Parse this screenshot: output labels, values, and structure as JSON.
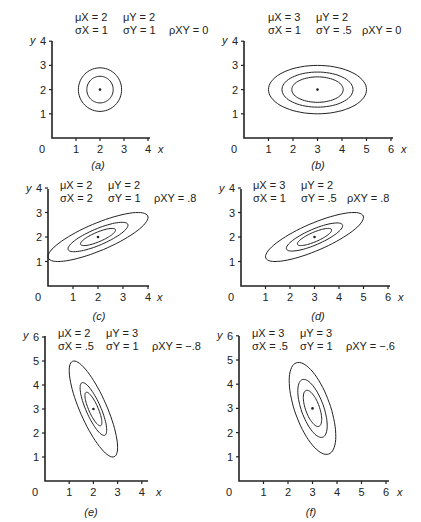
{
  "chart_data": [
    {
      "type": "contour",
      "panel": "a",
      "label": "(a)",
      "params": {
        "mu_x": 2,
        "mu_y": 2,
        "sigma_x": 1,
        "sigma_y": 1,
        "rho_xy": 0
      },
      "param_text": [
        "μX = 2",
        "μY = 2",
        "σX = 1",
        "σY = 1",
        "ρXY = 0"
      ],
      "xlabel": "x",
      "ylabel": "y",
      "xticks": [
        0,
        1,
        2,
        3,
        4
      ],
      "yticks": [
        1,
        2,
        3,
        4
      ],
      "xlim": [
        0,
        4
      ],
      "ylim": [
        0,
        4
      ],
      "contour_levels_sigma": [
        0.55,
        0.9
      ],
      "center": [
        2,
        2
      ]
    },
    {
      "type": "contour",
      "panel": "b",
      "label": "(b)",
      "params": {
        "mu_x": 3,
        "mu_y": 2,
        "sigma_x": 1,
        "sigma_y": 0.5,
        "rho_xy": 0
      },
      "param_text": [
        "μX = 3",
        "μY = 2",
        "σX = 1",
        "σY = .5",
        "ρXY = 0"
      ],
      "xlabel": "x",
      "ylabel": "y",
      "xticks": [
        0,
        1,
        2,
        3,
        4,
        5,
        6
      ],
      "yticks": [
        1,
        2,
        3,
        4
      ],
      "xlim": [
        0,
        6
      ],
      "ylim": [
        0,
        4
      ],
      "contour_levels_sigma": [
        1.05,
        1.45,
        2.0
      ],
      "center": [
        3,
        2
      ]
    },
    {
      "type": "contour",
      "panel": "c",
      "label": "(c)",
      "params": {
        "mu_x": 2,
        "mu_y": 2,
        "sigma_x": 2,
        "sigma_y": 1,
        "rho_xy": 0.8
      },
      "param_text": [
        "μX = 2",
        "μY = 2",
        "σX = 2",
        "σY = 1",
        "ρXY = .8"
      ],
      "xlabel": "x",
      "ylabel": "y",
      "xticks": [
        0,
        1,
        2,
        3,
        4
      ],
      "yticks": [
        1,
        2,
        3,
        4
      ],
      "xlim": [
        0,
        4
      ],
      "ylim": [
        0,
        4
      ],
      "contour_levels_sigma": [
        0.35,
        0.6,
        1.0
      ],
      "center": [
        2,
        2
      ]
    },
    {
      "type": "contour",
      "panel": "d",
      "label": "(d)",
      "params": {
        "mu_x": 3,
        "mu_y": 2,
        "sigma_x": 1,
        "sigma_y": 0.5,
        "rho_xy": 0.8
      },
      "param_text": [
        "μX = 3",
        "μY = 2",
        "σX = 1",
        "σY = .5",
        "ρXY = .8"
      ],
      "xlabel": "x",
      "ylabel": "y",
      "xticks": [
        0,
        1,
        2,
        3,
        4,
        5,
        6
      ],
      "yticks": [
        1,
        2,
        3,
        4
      ],
      "xlim": [
        0,
        6
      ],
      "ylim": [
        0,
        4
      ],
      "contour_levels_sigma": [
        0.7,
        1.15,
        2.0
      ],
      "center": [
        3,
        2
      ]
    },
    {
      "type": "contour",
      "panel": "e",
      "label": "(e)",
      "params": {
        "mu_x": 2,
        "mu_y": 3,
        "sigma_x": 0.5,
        "sigma_y": 1,
        "rho_xy": -0.8
      },
      "param_text": [
        "μX = 2",
        "μY = 3",
        "σX = .5",
        "σY = 1",
        "ρXY = −.8"
      ],
      "xlabel": "x",
      "ylabel": "y",
      "xticks": [
        0,
        1,
        2,
        3,
        4
      ],
      "yticks": [
        1,
        2,
        3,
        4,
        5,
        6
      ],
      "xlim": [
        0,
        4
      ],
      "ylim": [
        0,
        6
      ],
      "contour_levels_sigma": [
        0.7,
        1.1,
        2.0
      ],
      "center": [
        2,
        3
      ]
    },
    {
      "type": "contour",
      "panel": "f",
      "label": "(f)",
      "params": {
        "mu_x": 3,
        "mu_y": 3,
        "sigma_x": 0.5,
        "sigma_y": 1,
        "rho_xy": -0.6
      },
      "param_text": [
        "μX = 3",
        "μY = 3",
        "σX = .5",
        "σY = 1",
        "ρXY = −.6"
      ],
      "xlabel": "x",
      "ylabel": "y",
      "xticks": [
        0,
        1,
        2,
        3,
        4,
        5,
        6
      ],
      "yticks": [
        1,
        2,
        3,
        4,
        5,
        6
      ],
      "xlim": [
        0,
        6
      ],
      "ylim": [
        0,
        6
      ],
      "contour_levels_sigma": [
        0.75,
        1.2,
        1.9
      ],
      "center": [
        3,
        3
      ]
    }
  ],
  "layout": [
    {
      "ox": 52,
      "oy": 138,
      "ux": 24,
      "uy": 24.2,
      "xmaxpx": 150,
      "ytop": 41,
      "px": 75,
      "py": 8,
      "lx": 98,
      "ly": 160
    },
    {
      "ox": 244,
      "oy": 138,
      "ux": 24.5,
      "uy": 24.2,
      "xmaxpx": 393,
      "ytop": 41,
      "px": 268,
      "py": 8,
      "lx": 318,
      "ly": 160
    },
    {
      "ox": 48,
      "oy": 286,
      "ux": 25,
      "uy": 24.5,
      "xmaxpx": 149,
      "ytop": 189,
      "px": 60,
      "py": 176,
      "lx": 99,
      "ly": 311
    },
    {
      "ox": 241,
      "oy": 286,
      "ux": 24.5,
      "uy": 24.5,
      "xmaxpx": 390,
      "ytop": 189,
      "px": 253,
      "py": 176,
      "lx": 318,
      "ly": 311
    },
    {
      "ox": 45,
      "oy": 481,
      "ux": 24.2,
      "uy": 24,
      "xmaxpx": 148,
      "ytop": 336,
      "px": 58,
      "py": 324,
      "lx": 91,
      "ly": 507
    },
    {
      "ox": 239,
      "oy": 481,
      "ux": 24.5,
      "uy": 24.2,
      "xmaxpx": 389,
      "ytop": 336,
      "px": 252,
      "py": 324,
      "lx": 311,
      "ly": 507
    }
  ]
}
